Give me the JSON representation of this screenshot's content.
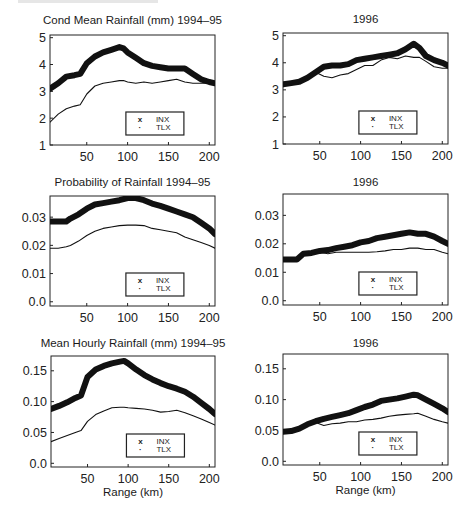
{
  "figure": {
    "legend": [
      {
        "marker": "x",
        "label": "INX"
      },
      {
        "marker": "·",
        "label": "TLX"
      }
    ],
    "xlabel": "Range (km)"
  },
  "chart_data": [
    {
      "id": "cond-mean-9495",
      "type": "line",
      "title": "Cond Mean Rainfall (mm) 1994–95",
      "xlabel": "",
      "ylabel": "",
      "xlim": [
        5,
        207
      ],
      "ylim": [
        1,
        5.1
      ],
      "xticks": [
        50,
        100,
        150,
        200
      ],
      "yticks": [
        1,
        2,
        3,
        4,
        5
      ],
      "ytick_labels": [
        "1",
        "2",
        "3",
        "4",
        "5"
      ],
      "legend_position": "lower right",
      "x": [
        5,
        15,
        25,
        35,
        42,
        50,
        60,
        70,
        80,
        90,
        95,
        100,
        110,
        120,
        130,
        140,
        150,
        160,
        170,
        180,
        190,
        200,
        207
      ],
      "series": [
        {
          "name": "INX",
          "marker": "x",
          "values": [
            3.1,
            3.3,
            3.55,
            3.6,
            3.65,
            4.05,
            4.3,
            4.45,
            4.55,
            4.65,
            4.6,
            4.45,
            4.25,
            4.05,
            3.95,
            3.9,
            3.85,
            3.85,
            3.85,
            3.65,
            3.45,
            3.35,
            3.3
          ]
        },
        {
          "name": "TLX",
          "marker": "·",
          "values": [
            1.85,
            2.15,
            2.35,
            2.45,
            2.5,
            2.9,
            3.2,
            3.3,
            3.35,
            3.4,
            3.4,
            3.35,
            3.3,
            3.35,
            3.3,
            3.35,
            3.4,
            3.45,
            3.35,
            3.3,
            3.3,
            3.3,
            3.3
          ]
        }
      ]
    },
    {
      "id": "cond-mean-96",
      "type": "line",
      "title": "1996",
      "xlabel": "",
      "ylabel": "",
      "xlim": [
        5,
        207
      ],
      "ylim": [
        1,
        5.1
      ],
      "xticks": [
        50,
        100,
        150,
        200
      ],
      "yticks": [
        1,
        2,
        3,
        4,
        5
      ],
      "ytick_labels": [
        "1",
        "2",
        "3",
        "4",
        "5"
      ],
      "legend_position": "lower right",
      "x": [
        5,
        15,
        25,
        35,
        45,
        55,
        65,
        75,
        85,
        95,
        105,
        115,
        125,
        135,
        145,
        155,
        165,
        172,
        180,
        190,
        200,
        207
      ],
      "series": [
        {
          "name": "INX",
          "marker": "x",
          "values": [
            3.2,
            3.25,
            3.3,
            3.45,
            3.65,
            3.85,
            3.9,
            3.9,
            3.95,
            4.1,
            4.15,
            4.2,
            4.25,
            4.3,
            4.35,
            4.5,
            4.7,
            4.55,
            4.25,
            4.1,
            4.0,
            3.9
          ]
        },
        {
          "name": "TLX",
          "marker": "·",
          "values": [
            3.15,
            3.2,
            3.25,
            3.45,
            3.65,
            3.5,
            3.45,
            3.55,
            3.6,
            3.75,
            3.9,
            3.9,
            4.1,
            4.2,
            4.15,
            4.25,
            4.2,
            4.2,
            4.05,
            3.85,
            3.8,
            3.8
          ]
        }
      ]
    },
    {
      "id": "prob-9495",
      "type": "line",
      "title": "Probability of Rainfall 1994–95",
      "xlabel": "",
      "ylabel": "",
      "xlim": [
        5,
        207
      ],
      "ylim": [
        -0.0015,
        0.0375
      ],
      "xticks": [
        50,
        100,
        150,
        200
      ],
      "yticks": [
        0.0,
        0.01,
        0.02,
        0.03
      ],
      "ytick_labels": [
        "0.0",
        "0.01",
        "0.02",
        "0.03"
      ],
      "legend_position": "lower right",
      "x": [
        5,
        15,
        25,
        30,
        40,
        50,
        60,
        70,
        80,
        90,
        100,
        110,
        120,
        130,
        140,
        150,
        160,
        170,
        180,
        190,
        200,
        207
      ],
      "series": [
        {
          "name": "INX",
          "marker": "x",
          "values": [
            0.0285,
            0.0285,
            0.0285,
            0.0295,
            0.031,
            0.033,
            0.0345,
            0.035,
            0.0355,
            0.036,
            0.0368,
            0.0368,
            0.036,
            0.0348,
            0.034,
            0.033,
            0.032,
            0.031,
            0.03,
            0.028,
            0.026,
            0.024
          ]
        },
        {
          "name": "TLX",
          "marker": "·",
          "values": [
            0.019,
            0.019,
            0.0195,
            0.02,
            0.0215,
            0.0235,
            0.025,
            0.026,
            0.0265,
            0.027,
            0.0272,
            0.0272,
            0.027,
            0.026,
            0.0255,
            0.025,
            0.0245,
            0.023,
            0.022,
            0.021,
            0.02,
            0.019
          ]
        }
      ]
    },
    {
      "id": "prob-96",
      "type": "line",
      "title": "1996",
      "xlabel": "",
      "ylabel": "",
      "xlim": [
        5,
        207
      ],
      "ylim": [
        -0.0015,
        0.0375
      ],
      "xticks": [
        50,
        100,
        150,
        200
      ],
      "yticks": [
        0.0,
        0.01,
        0.02,
        0.03
      ],
      "ytick_labels": [
        "0.0",
        "0.01",
        "0.02",
        "0.03"
      ],
      "legend_position": "lower right",
      "x": [
        5,
        15,
        22,
        30,
        40,
        50,
        60,
        70,
        80,
        90,
        100,
        110,
        120,
        130,
        140,
        150,
        160,
        170,
        180,
        190,
        200,
        207
      ],
      "series": [
        {
          "name": "INX",
          "marker": "x",
          "values": [
            0.0145,
            0.0145,
            0.0145,
            0.0165,
            0.0168,
            0.0175,
            0.0178,
            0.0185,
            0.019,
            0.0195,
            0.0205,
            0.021,
            0.022,
            0.0225,
            0.023,
            0.0235,
            0.024,
            0.0235,
            0.0235,
            0.0225,
            0.021,
            0.02
          ]
        },
        {
          "name": "TLX",
          "marker": "·",
          "values": [
            0.014,
            0.0145,
            0.0145,
            0.016,
            0.0165,
            0.017,
            0.0165,
            0.017,
            0.017,
            0.017,
            0.017,
            0.017,
            0.0172,
            0.0175,
            0.018,
            0.018,
            0.0185,
            0.0185,
            0.018,
            0.018,
            0.017,
            0.0165
          ]
        }
      ]
    },
    {
      "id": "mean-hourly-9495",
      "type": "line",
      "title": "Mean Hourly Rainfall (mm) 1994–95",
      "xlabel": "Range (km)",
      "ylabel": "",
      "xlim": [
        5,
        207
      ],
      "ylim": [
        -0.006,
        0.174
      ],
      "xticks": [
        50,
        100,
        150,
        200
      ],
      "yticks": [
        0.0,
        0.05,
        0.1,
        0.15
      ],
      "ytick_labels": [
        "0.0",
        "0.05",
        "0.10",
        "0.15"
      ],
      "legend_position": "lower right",
      "x": [
        5,
        15,
        25,
        35,
        42,
        50,
        60,
        70,
        80,
        90,
        95,
        100,
        110,
        120,
        130,
        140,
        150,
        160,
        170,
        180,
        190,
        200,
        207
      ],
      "series": [
        {
          "name": "INX",
          "marker": "x",
          "values": [
            0.088,
            0.093,
            0.099,
            0.106,
            0.11,
            0.14,
            0.152,
            0.158,
            0.162,
            0.165,
            0.166,
            0.162,
            0.152,
            0.143,
            0.136,
            0.13,
            0.125,
            0.121,
            0.116,
            0.108,
            0.098,
            0.088,
            0.08
          ]
        },
        {
          "name": "TLX",
          "marker": "·",
          "values": [
            0.035,
            0.04,
            0.045,
            0.05,
            0.053,
            0.068,
            0.079,
            0.085,
            0.09,
            0.091,
            0.091,
            0.09,
            0.089,
            0.088,
            0.086,
            0.083,
            0.084,
            0.086,
            0.082,
            0.077,
            0.072,
            0.066,
            0.062
          ]
        }
      ]
    },
    {
      "id": "mean-hourly-96",
      "type": "line",
      "title": "1996",
      "xlabel": "Range (km)",
      "ylabel": "",
      "xlim": [
        5,
        207
      ],
      "ylim": [
        -0.006,
        0.174
      ],
      "xticks": [
        50,
        100,
        150,
        200
      ],
      "yticks": [
        0.0,
        0.05,
        0.1,
        0.15
      ],
      "ytick_labels": [
        "0.0",
        "0.05",
        "0.10",
        "0.15"
      ],
      "legend_position": "lower right",
      "x": [
        5,
        15,
        25,
        35,
        45,
        55,
        65,
        75,
        85,
        95,
        105,
        115,
        125,
        135,
        145,
        155,
        165,
        170,
        180,
        190,
        200,
        207
      ],
      "series": [
        {
          "name": "INX",
          "marker": "x",
          "values": [
            0.048,
            0.049,
            0.053,
            0.06,
            0.065,
            0.069,
            0.072,
            0.075,
            0.078,
            0.083,
            0.088,
            0.092,
            0.098,
            0.1,
            0.102,
            0.105,
            0.108,
            0.107,
            0.1,
            0.093,
            0.086,
            0.08
          ]
        },
        {
          "name": "TLX",
          "marker": "·",
          "values": [
            0.046,
            0.048,
            0.052,
            0.058,
            0.063,
            0.058,
            0.061,
            0.062,
            0.064,
            0.064,
            0.067,
            0.068,
            0.07,
            0.073,
            0.075,
            0.076,
            0.077,
            0.078,
            0.073,
            0.068,
            0.064,
            0.062
          ]
        }
      ]
    }
  ]
}
